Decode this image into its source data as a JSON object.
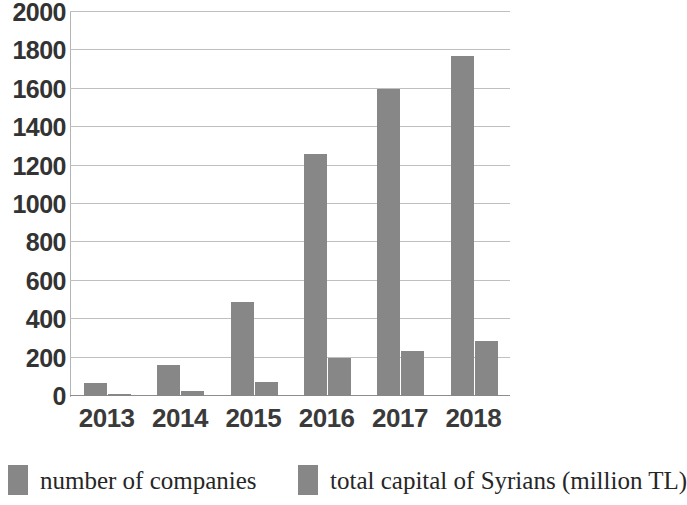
{
  "chart_data": {
    "type": "bar",
    "title": "",
    "subtitle": "",
    "xlabel": "",
    "ylabel": "",
    "categories": [
      "2013",
      "2014",
      "2015",
      "2016",
      "2017",
      "2018"
    ],
    "series": [
      {
        "name": "number of companies",
        "color": "#878787",
        "values": [
          70,
          160,
          490,
          1260,
          1600,
          1770
        ]
      },
      {
        "name": "total capital of Syrians (million TL)",
        "color": "#878787",
        "values": [
          10,
          25,
          75,
          200,
          235,
          285
        ]
      }
    ],
    "ylim": [
      0,
      2000
    ],
    "y_ticks": [
      0,
      200,
      400,
      600,
      800,
      1000,
      1200,
      1400,
      1600,
      1800,
      2000
    ],
    "y_tick_labels": [
      "0",
      "200",
      "400",
      "600",
      "800",
      "1000",
      "1200",
      "1400",
      "1600",
      "1800",
      "2000"
    ],
    "grid": true,
    "grid_axis": "y",
    "legend_position": "bottom"
  },
  "legend": {
    "entries": [
      {
        "label": "number of companies",
        "swatch_color": "#878787"
      },
      {
        "label": "total capital of Syrians (million TL)",
        "swatch_color": "#878787"
      }
    ]
  },
  "colors": {
    "bar": "#878787",
    "gridline": "#bfbfbf",
    "axis": "#8d8d8d",
    "text": "#333333",
    "background": "#ffffff"
  }
}
